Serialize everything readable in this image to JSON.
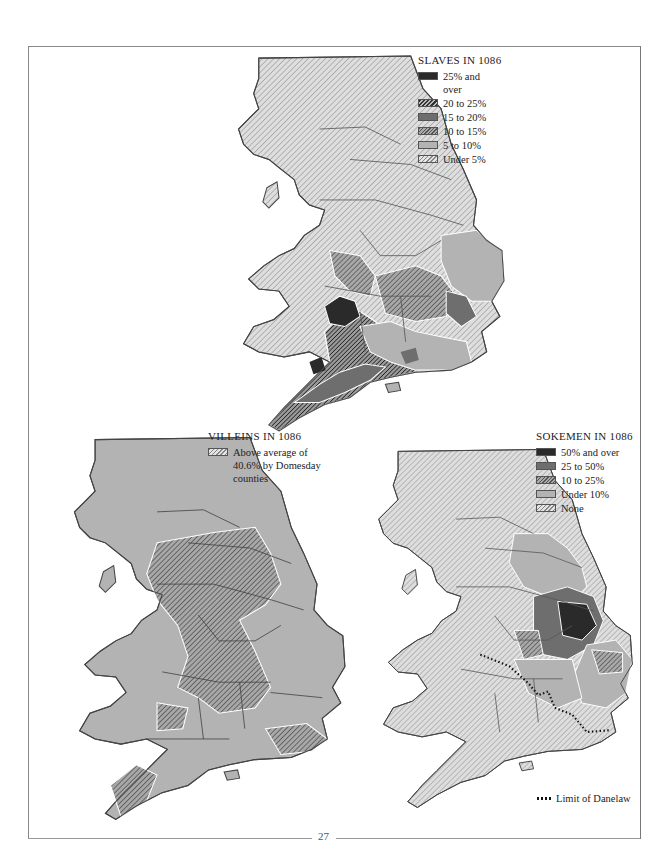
{
  "page": {
    "number": "27"
  },
  "maps": {
    "slaves": {
      "title": "SLAVES IN 1086",
      "legend": [
        {
          "label": "25% and over",
          "swatch": "black"
        },
        {
          "label": "20 to 25%",
          "swatch": "hatch-dark"
        },
        {
          "label": "15 to 20%",
          "swatch": "dark"
        },
        {
          "label": "10 to 15%",
          "swatch": "hatch-mid"
        },
        {
          "label": "5 to 10%",
          "swatch": "mid"
        },
        {
          "label": "Under 5%",
          "swatch": "hatch-light"
        }
      ]
    },
    "villeins": {
      "title": "VILLEINS IN 1086",
      "legend": [
        {
          "label": "Above average of 40.6% by Domesday counties",
          "swatch": "hatch-mid"
        }
      ]
    },
    "sokemen": {
      "title": "SOKEMEN IN 1086",
      "legend": [
        {
          "label": "50% and over",
          "swatch": "black"
        },
        {
          "label": "25 to 50%",
          "swatch": "dark"
        },
        {
          "label": "10 to 25%",
          "swatch": "hatch-mid"
        },
        {
          "label": "Under 10%",
          "swatch": "mid"
        },
        {
          "label": "None",
          "swatch": "hatch-light"
        }
      ],
      "line_legend": {
        "label": "Limit of Danelaw",
        "style": "dotted"
      }
    }
  },
  "colors": {
    "black": "#2a2a2a",
    "dark": "#6e6e6e",
    "mid": "#b3b3b3",
    "hatch_light_bg": "#e4e4e4",
    "border": "#444444"
  }
}
